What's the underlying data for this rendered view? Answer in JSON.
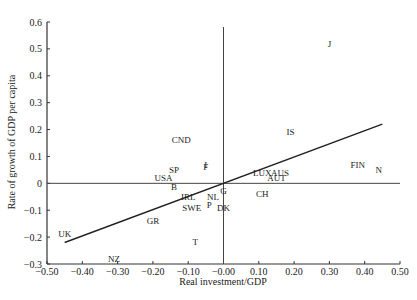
{
  "chart_data": {
    "type": "scatter",
    "title": "",
    "xlabel": "Real investment/GDP",
    "ylabel": "Rate of growth of GDP per capita",
    "xlim": [
      -0.5,
      0.5
    ],
    "ylim": [
      -0.3,
      0.6
    ],
    "x_ticks": [
      "-0.50",
      "-0.40",
      "-0.30",
      "-0.20",
      "-0.10",
      "-0.00",
      "0.10",
      "0.20",
      "0.30",
      "0.40",
      "0.50"
    ],
    "y_ticks": [
      "0.6",
      "0.5",
      "0.4",
      "0.3",
      "0.2",
      "0.1",
      "0",
      "-0.1",
      "-0.2",
      "-0.3"
    ],
    "grid": false,
    "reference_lines": {
      "x": 0,
      "y": 0
    },
    "points": [
      {
        "label": "J",
        "x": 0.3,
        "y": 0.52
      },
      {
        "label": "IS",
        "x": 0.19,
        "y": 0.19
      },
      {
        "label": "CND",
        "x": -0.12,
        "y": 0.16
      },
      {
        "label": "FIN",
        "x": 0.38,
        "y": 0.07
      },
      {
        "label": "N",
        "x": 0.44,
        "y": 0.05
      },
      {
        "label": "LUX",
        "x": 0.11,
        "y": 0.04
      },
      {
        "label": "AUS",
        "x": 0.16,
        "y": 0.04
      },
      {
        "label": "AUT",
        "x": 0.15,
        "y": 0.02
      },
      {
        "label": "CH",
        "x": 0.11,
        "y": -0.04
      },
      {
        "label": "USA",
        "x": -0.17,
        "y": 0.02
      },
      {
        "label": "SP",
        "x": -0.14,
        "y": 0.05
      },
      {
        "label": "F",
        "x": -0.05,
        "y": 0.06
      },
      {
        "label": "I",
        "x": -0.05,
        "y": 0.07
      },
      {
        "label": "B",
        "x": -0.14,
        "y": -0.015
      },
      {
        "label": "G",
        "x": 0.0,
        "y": -0.03
      },
      {
        "label": "IRL",
        "x": -0.1,
        "y": -0.05
      },
      {
        "label": "NL",
        "x": -0.03,
        "y": -0.05
      },
      {
        "label": "P",
        "x": -0.04,
        "y": -0.08
      },
      {
        "label": "SWE",
        "x": -0.09,
        "y": -0.09
      },
      {
        "label": "DK",
        "x": 0.0,
        "y": -0.09
      },
      {
        "label": "GR",
        "x": -0.2,
        "y": -0.14
      },
      {
        "label": "T",
        "x": -0.08,
        "y": -0.22
      },
      {
        "label": "UK",
        "x": -0.45,
        "y": -0.19
      },
      {
        "label": "NZ",
        "x": -0.31,
        "y": -0.28
      }
    ],
    "regression_line": {
      "x": [
        -0.45,
        0.45
      ],
      "y": [
        -0.22,
        0.22
      ]
    }
  }
}
